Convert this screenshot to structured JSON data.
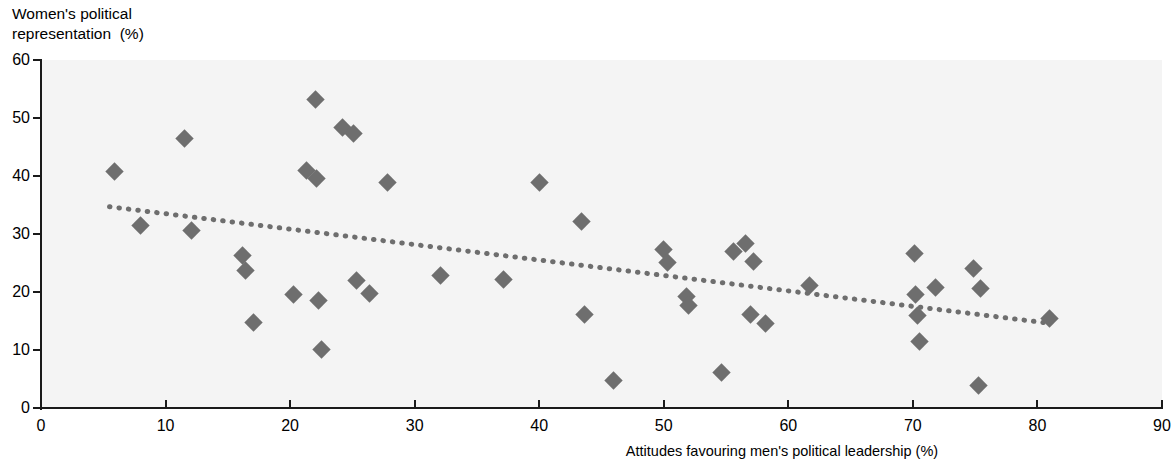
{
  "chart_data": {
    "type": "scatter",
    "title": "",
    "ylabel_line1": "Women's political",
    "ylabel_line2": "representation  (%)",
    "xlabel": "Attitudes favouring men's political leadership (%)",
    "xlim": [
      0,
      90
    ],
    "ylim": [
      0,
      60
    ],
    "xticks": [
      0,
      10,
      20,
      30,
      40,
      50,
      60,
      70,
      80,
      90
    ],
    "yticks": [
      0,
      10,
      20,
      30,
      40,
      50,
      60
    ],
    "grid": false,
    "legend": false,
    "marker_color": "#6e6e6e",
    "marker_shape": "diamond",
    "plot_background": "#f4f4f4",
    "axis_color": "#1a1a1a",
    "points": [
      {
        "x": 5.9,
        "y": 40.8
      },
      {
        "x": 8.0,
        "y": 31.4
      },
      {
        "x": 11.5,
        "y": 46.4
      },
      {
        "x": 12.1,
        "y": 30.6
      },
      {
        "x": 16.2,
        "y": 26.3
      },
      {
        "x": 16.4,
        "y": 23.7
      },
      {
        "x": 17.1,
        "y": 14.7
      },
      {
        "x": 20.3,
        "y": 19.5
      },
      {
        "x": 21.3,
        "y": 41.0
      },
      {
        "x": 22.0,
        "y": 53.2
      },
      {
        "x": 22.1,
        "y": 39.6
      },
      {
        "x": 22.3,
        "y": 18.6
      },
      {
        "x": 22.5,
        "y": 10.1
      },
      {
        "x": 24.2,
        "y": 48.3
      },
      {
        "x": 25.1,
        "y": 47.3
      },
      {
        "x": 25.3,
        "y": 21.9
      },
      {
        "x": 26.4,
        "y": 19.7
      },
      {
        "x": 27.8,
        "y": 38.9
      },
      {
        "x": 32.1,
        "y": 22.8
      },
      {
        "x": 37.1,
        "y": 22.1
      },
      {
        "x": 40.0,
        "y": 38.9
      },
      {
        "x": 43.4,
        "y": 32.2
      },
      {
        "x": 43.6,
        "y": 16.1
      },
      {
        "x": 46.0,
        "y": 4.8
      },
      {
        "x": 50.0,
        "y": 27.3
      },
      {
        "x": 50.3,
        "y": 25.1
      },
      {
        "x": 51.8,
        "y": 19.3
      },
      {
        "x": 52.0,
        "y": 17.7
      },
      {
        "x": 54.6,
        "y": 6.1
      },
      {
        "x": 55.6,
        "y": 27.0
      },
      {
        "x": 56.6,
        "y": 28.3
      },
      {
        "x": 57.2,
        "y": 25.3
      },
      {
        "x": 57.0,
        "y": 16.1
      },
      {
        "x": 58.2,
        "y": 14.6
      },
      {
        "x": 61.7,
        "y": 21.2
      },
      {
        "x": 70.1,
        "y": 26.7
      },
      {
        "x": 70.2,
        "y": 19.6
      },
      {
        "x": 70.4,
        "y": 15.9
      },
      {
        "x": 70.5,
        "y": 11.4
      },
      {
        "x": 71.8,
        "y": 20.8
      },
      {
        "x": 74.9,
        "y": 24.1
      },
      {
        "x": 75.4,
        "y": 20.6
      },
      {
        "x": 75.3,
        "y": 3.9
      },
      {
        "x": 81.0,
        "y": 15.5
      }
    ],
    "trendline": {
      "style": "dotted",
      "color": "#6e6e6e",
      "x_start": 5.5,
      "y_start": 34.7,
      "x_end": 81.0,
      "y_end": 14.6
    }
  }
}
